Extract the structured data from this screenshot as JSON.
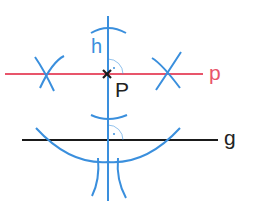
{
  "diagram": {
    "labels": {
      "h": "h",
      "P": "P",
      "p": "p",
      "g": "g"
    },
    "colors": {
      "construction": "#3a8fdd",
      "parallel_line": "#e8556b",
      "given_line": "#1a1a1a",
      "point": "#1a1a1a",
      "background": "#ffffff"
    },
    "elements": {
      "line_h": {
        "name": "perpendicular h",
        "x": 108,
        "y1": 16,
        "y2": 201
      },
      "line_p": {
        "name": "parallel p",
        "y": 74,
        "x1": 5,
        "x2": 203
      },
      "line_g": {
        "name": "given line g",
        "y": 140,
        "x1": 22,
        "x2": 218
      },
      "point_P": {
        "x": 107,
        "y": 74
      },
      "right_angles": [
        {
          "x": 108,
          "y": 74
        },
        {
          "x": 108,
          "y": 140
        }
      ]
    }
  }
}
